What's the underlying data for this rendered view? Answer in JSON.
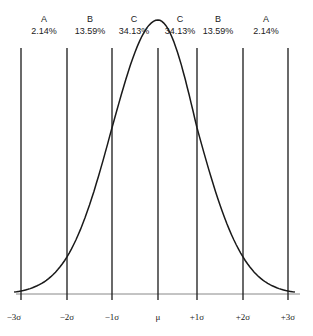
{
  "chart_data": {
    "type": "line",
    "title": "",
    "xlabel": "",
    "ylabel": "",
    "x": [
      "-3σ",
      "-2σ",
      "-1σ",
      "μ",
      "+1σ",
      "+2σ",
      "+3σ"
    ],
    "x_numeric": [
      -3,
      -2,
      -1,
      0,
      1,
      2,
      3
    ],
    "regions": [
      {
        "letter": "A",
        "percent": "2.14%",
        "from": "-3σ",
        "to": "-2σ"
      },
      {
        "letter": "B",
        "percent": "13.59%",
        "from": "-2σ",
        "to": "-1σ"
      },
      {
        "letter": "C",
        "percent": "34.13%",
        "from": "-1σ",
        "to": "μ"
      },
      {
        "letter": "C",
        "percent": "34.13%",
        "from": "μ",
        "to": "+1σ"
      },
      {
        "letter": "B",
        "percent": "13.59%",
        "from": "+1σ",
        "to": "+2σ"
      },
      {
        "letter": "A",
        "percent": "2.14%",
        "from": "+2σ",
        "to": "+3σ"
      }
    ],
    "grid": false,
    "legend": "none",
    "xlim": [
      -3,
      3
    ]
  },
  "labels": {
    "ticks": [
      "−3σ",
      "−2σ",
      "−1σ",
      "μ",
      "+1σ",
      "+2σ",
      "+3σ"
    ],
    "letters": [
      "A",
      "B",
      "C",
      "C",
      "B",
      "A"
    ],
    "percents": [
      "2.14%",
      "13.59%",
      "34.13%",
      "34.13%",
      "13.59%",
      "2.14%"
    ]
  },
  "colors": {
    "line": "#1a1a1a",
    "axis": "#888888"
  }
}
